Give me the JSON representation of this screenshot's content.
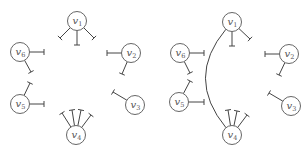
{
  "diagrams": [
    {
      "id": "left",
      "nodes": [
        {
          "label": "v",
          "sub": "1",
          "x": 77,
          "y": 21
        },
        {
          "label": "v",
          "sub": "2",
          "x": 131,
          "y": 53
        },
        {
          "label": "v",
          "sub": "3",
          "x": 135,
          "y": 105
        },
        {
          "label": "v",
          "sub": "4",
          "x": 76,
          "y": 135
        },
        {
          "label": "v",
          "sub": "5",
          "x": 20,
          "y": 104
        },
        {
          "label": "v",
          "sub": "6",
          "x": 20,
          "y": 52
        }
      ],
      "stubs": [
        {
          "from": 0,
          "dx": -17,
          "dy": 17
        },
        {
          "from": 0,
          "dx": 0,
          "dy": 24
        },
        {
          "from": 0,
          "dx": 17,
          "dy": 17
        },
        {
          "from": 1,
          "dx": -24,
          "dy": 0
        },
        {
          "from": 1,
          "dx": -9,
          "dy": 21
        },
        {
          "from": 2,
          "dx": -22,
          "dy": -13
        },
        {
          "from": 3,
          "dx": -14,
          "dy": -22
        },
        {
          "from": 3,
          "dx": -4,
          "dy": -25
        },
        {
          "from": 3,
          "dx": 5,
          "dy": -25
        },
        {
          "from": 3,
          "dx": 15,
          "dy": -20
        },
        {
          "from": 4,
          "dx": 24,
          "dy": 0
        },
        {
          "from": 4,
          "dx": 10,
          "dy": -21
        },
        {
          "from": 5,
          "dx": 24,
          "dy": 0
        },
        {
          "from": 5,
          "dx": 11,
          "dy": 20
        }
      ],
      "arcs": []
    },
    {
      "id": "right",
      "nodes": [
        {
          "label": "v",
          "sub": "1",
          "x": 232,
          "y": 22
        },
        {
          "label": "v",
          "sub": "2",
          "x": 289,
          "y": 54
        },
        {
          "label": "v",
          "sub": "3",
          "x": 291,
          "y": 106
        },
        {
          "label": "v",
          "sub": "4",
          "x": 232,
          "y": 135
        },
        {
          "label": "v",
          "sub": "5",
          "x": 179,
          "y": 102
        },
        {
          "label": "v",
          "sub": "6",
          "x": 180,
          "y": 53
        }
      ],
      "stubs": [
        {
          "from": 0,
          "dx": 0,
          "dy": 24
        },
        {
          "from": 0,
          "dx": 18,
          "dy": 17
        },
        {
          "from": 1,
          "dx": -24,
          "dy": 0
        },
        {
          "from": 1,
          "dx": -10,
          "dy": 21
        },
        {
          "from": 2,
          "dx": -22,
          "dy": -13
        },
        {
          "from": 3,
          "dx": -4,
          "dy": -25
        },
        {
          "from": 3,
          "dx": 5,
          "dy": -24
        },
        {
          "from": 3,
          "dx": 15,
          "dy": -20
        },
        {
          "from": 4,
          "dx": 25,
          "dy": 0
        },
        {
          "from": 4,
          "dx": 11,
          "dy": -21
        },
        {
          "from": 5,
          "dx": 24,
          "dy": 0
        },
        {
          "from": 5,
          "dx": 10,
          "dy": 20
        }
      ],
      "arcs": [
        {
          "from": 0,
          "to": 3,
          "cx": 185,
          "cy": 78
        }
      ]
    }
  ],
  "style": {
    "node_radius": 9.5,
    "stroke_color": "#444444",
    "node_stroke": "#555555",
    "tee_half_width": 3
  }
}
